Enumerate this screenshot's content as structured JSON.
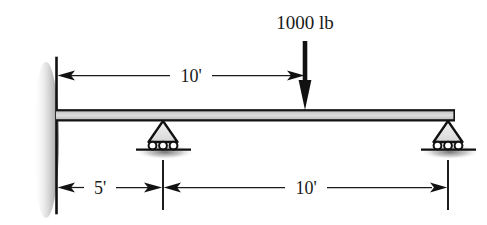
{
  "figure": {
    "type": "statics-beam-free-body-diagram",
    "background_color": "#ffffff",
    "ink_color": "#1a1a1a",
    "beam_fill_color": "#d2d2d2",
    "shadow_color": "#9a9a9a"
  },
  "load": {
    "label": "1000 lb",
    "magnitude": 1000,
    "unit": "lb",
    "direction": "down",
    "position_label": "10' from wall",
    "icon": "downward-force-arrow-icon"
  },
  "beam": {
    "name": "beam",
    "left_end_label": "wall",
    "right_end_label": "roller-support-right"
  },
  "supports": [
    {
      "id": "left-wall",
      "kind": "wall-reference-line",
      "icon": "vertical-wall-icon"
    },
    {
      "id": "roller-left",
      "kind": "roller",
      "icon": "roller-support-icon",
      "rollers": 3
    },
    {
      "id": "roller-right",
      "kind": "roller",
      "icon": "roller-support-icon",
      "rollers": 3
    }
  ],
  "dimensions": {
    "top": {
      "label": "10'",
      "value": 10,
      "unit": "ft",
      "from": "wall",
      "to": "load-point",
      "arrows": "both"
    },
    "bottom_left": {
      "label": "5'",
      "value": 5,
      "unit": "ft",
      "from": "wall",
      "to": "roller-left",
      "arrows": "both"
    },
    "bottom_right": {
      "label": "10'",
      "value": 10,
      "unit": "ft",
      "from": "roller-left",
      "to": "roller-right",
      "arrows": "both"
    }
  },
  "cropped_header": {
    "text": ""
  }
}
